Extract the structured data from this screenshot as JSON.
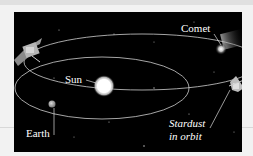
{
  "diagram": {
    "title": "",
    "labels": {
      "comet": "Comet",
      "sun": "Sun",
      "earth": "Earth",
      "stardust_line1": "Stardust",
      "stardust_line2": "in orbit"
    },
    "colors": {
      "background": "#000000",
      "orbit": "#cfcfcf",
      "text": "#ffffff",
      "page": "#f2f2f2"
    }
  }
}
